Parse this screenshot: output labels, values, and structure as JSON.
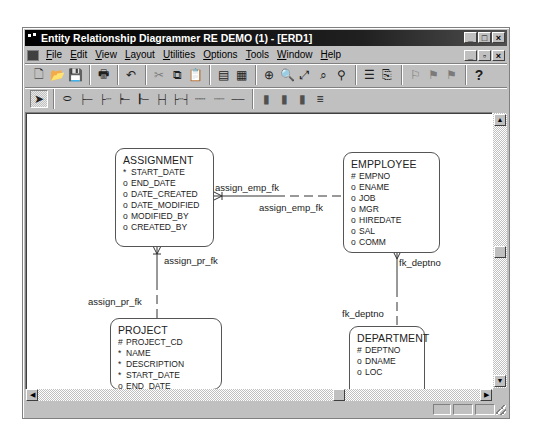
{
  "window": {
    "title": "Entity Relationship Diagrammer RE DEMO (1) - [ERD1]",
    "controls": [
      "_",
      "□",
      "×"
    ],
    "mdi_controls": [
      "_",
      "▫",
      "×"
    ]
  },
  "menubar": {
    "items": [
      {
        "label": "File",
        "u": "F",
        "rest": "ile"
      },
      {
        "label": "Edit",
        "u": "E",
        "rest": "dit"
      },
      {
        "label": "View",
        "u": "V",
        "rest": "iew"
      },
      {
        "label": "Layout",
        "u": "L",
        "rest": "ayout"
      },
      {
        "label": "Utilities",
        "u": "U",
        "rest": "tilities"
      },
      {
        "label": "Options",
        "u": "O",
        "rest": "ptions"
      },
      {
        "label": "Tools",
        "u": "T",
        "rest": "ools"
      },
      {
        "label": "Window",
        "u": "W",
        "rest": "indow"
      },
      {
        "label": "Help",
        "u": "H",
        "rest": "elp"
      }
    ]
  },
  "toolbar1": {
    "icons": {
      "new": "🗋",
      "open": "📂",
      "save": "💾",
      "print": "🖶",
      "undo": "↶",
      "cut": "✂",
      "copy": "⧉",
      "paste": "📋",
      "cols1": "▤",
      "cols2": "▦",
      "zoom_in": "⊕",
      "zoom_out": "🔍",
      "fit": "⤢",
      "find1": "⌕",
      "find2": "⚲",
      "align": "☰",
      "arrange": "⎘",
      "dim1": "⚐",
      "dim2": "⚑",
      "dim3": "⚑",
      "help": "?"
    }
  },
  "toolbar2": {
    "icons": {
      "select": "➤",
      "entity": "⬭",
      "rel1": "├─",
      "rel2": "├┄",
      "rel3": "┝─",
      "rel4": "┠─",
      "rel5": "├┤",
      "rel6": "├┄┤",
      "rel7": "┄┄",
      "rel8": "┈┈",
      "rel9": "──",
      "color1": "▮",
      "color2": "▮",
      "color3": "▮",
      "color4": "≡"
    }
  },
  "entities": [
    {
      "name": "ASSIGNMENT",
      "attributes": [
        {
          "marker": "*",
          "name": "START_DATE"
        },
        {
          "marker": "o",
          "name": "END_DATE"
        },
        {
          "marker": "o",
          "name": "DATE_CREATED"
        },
        {
          "marker": "o",
          "name": "DATE_MODIFIED"
        },
        {
          "marker": "o",
          "name": "MODIFIED_BY"
        },
        {
          "marker": "o",
          "name": "CREATED_BY"
        }
      ]
    },
    {
      "name": "EMPPLOYEE",
      "attributes": [
        {
          "marker": "#",
          "name": "EMPNO"
        },
        {
          "marker": "o",
          "name": "ENAME"
        },
        {
          "marker": "o",
          "name": "JOB"
        },
        {
          "marker": "o",
          "name": "MGR"
        },
        {
          "marker": "o",
          "name": "HIREDATE"
        },
        {
          "marker": "o",
          "name": "SAL"
        },
        {
          "marker": "o",
          "name": "COMM"
        }
      ]
    },
    {
      "name": "PROJECT",
      "attributes": [
        {
          "marker": "#",
          "name": "PROJECT_CD"
        },
        {
          "marker": "*",
          "name": "NAME"
        },
        {
          "marker": "*",
          "name": "DESCRIPTION"
        },
        {
          "marker": "*",
          "name": "START_DATE"
        },
        {
          "marker": "o",
          "name": "END_DATE"
        }
      ]
    },
    {
      "name": "DEPARTMENT",
      "attributes": [
        {
          "marker": "#",
          "name": "DEPTNO"
        },
        {
          "marker": "o",
          "name": "DNAME"
        },
        {
          "marker": "o",
          "name": "LOC"
        }
      ]
    }
  ],
  "relationships": [
    {
      "from_label": "assign_emp_fk",
      "to_label": "assign_emp_fk"
    },
    {
      "from_label": "assign_pr_fk",
      "to_label": "assign_pr_fk"
    },
    {
      "from_label": "fk_deptno",
      "to_label": "fk_deptno"
    }
  ],
  "scrollbars": {
    "up": "▲",
    "down": "▼",
    "left": "◀",
    "right": "▶"
  }
}
